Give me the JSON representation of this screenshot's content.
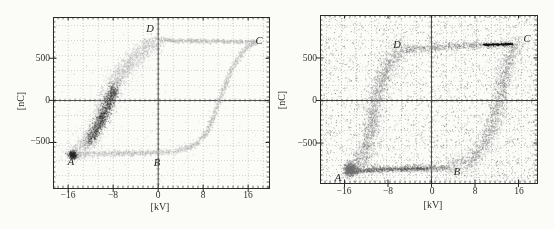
{
  "figure": {
    "background": "#fbfbf8"
  },
  "chart_data": [
    {
      "type": "scatter",
      "panel": "left",
      "title": "",
      "xlabel": "[kV]",
      "ylabel": "[nC]",
      "xlim": [
        -18.7,
        19.7
      ],
      "ylim": [
        -1040,
        990
      ],
      "xticks": [
        -16,
        -8,
        0,
        8,
        16
      ],
      "xtick_labels": [
        "−16",
        "−8",
        "0",
        "8",
        "16"
      ],
      "yticks": [
        -500,
        0,
        500
      ],
      "ytick_labels": [
        "−500",
        "0",
        "500"
      ],
      "grid": "fine-dotted",
      "grid_spacing_px": 15,
      "zero_axes": true,
      "seed": 7,
      "colors": {
        "loop": "#b0b0b0",
        "core": "#262626"
      },
      "corner_labels": [
        {
          "text": "A",
          "x": -15.6,
          "y": -730
        },
        {
          "text": "B",
          "x": -0.2,
          "y": -735
        },
        {
          "text": "C",
          "x": 17.9,
          "y": 715
        },
        {
          "text": "D",
          "x": -1.5,
          "y": 860
        }
      ],
      "loop_summary": {
        "bottom_branch_nC": -630,
        "top_branch_nC": 705,
        "coercive_up_kV": 10.8,
        "descending_band_center_kV": -9.5,
        "A": [
          -15.5,
          -648
        ],
        "B": [
          1.8,
          -616
        ],
        "C": [
          17.5,
          692
        ],
        "D": [
          0.3,
          720
        ]
      },
      "branches": [
        {
          "name": "bottom-A-to-B",
          "points": [
            [
              -15.5,
              -648
            ],
            [
              -13,
              -638
            ],
            [
              -10,
              -632
            ],
            [
              -7,
              -628
            ],
            [
              -4,
              -625
            ],
            [
              -1,
              -621
            ],
            [
              1.8,
              -616
            ]
          ],
          "n": 700,
          "sx": 0.18,
          "sy": 18,
          "color": "#b0b0b0",
          "alpha": 0.5,
          "size": 1
        },
        {
          "name": "rising-B-to-C",
          "points": [
            [
              1.8,
              -616
            ],
            [
              4.5,
              -585
            ],
            [
              6.5,
              -528
            ],
            [
              8,
              -440
            ],
            [
              9,
              -330
            ],
            [
              10,
              -180
            ],
            [
              10.8,
              -20
            ],
            [
              11.8,
              160
            ],
            [
              12.8,
              330
            ],
            [
              13.8,
              460
            ],
            [
              14.8,
              560
            ],
            [
              15.8,
              630
            ],
            [
              16.8,
              672
            ],
            [
              17.5,
              692
            ]
          ],
          "n": 1000,
          "sx": 0.22,
          "sy": 22,
          "color": "#b0b0b0",
          "alpha": 0.5,
          "size": 1
        },
        {
          "name": "top-C-to-D",
          "points": [
            [
              17.5,
              692
            ],
            [
              14,
              698
            ],
            [
              10,
              701
            ],
            [
              6,
              705
            ],
            [
              2,
              710
            ],
            [
              0.3,
              720
            ]
          ],
          "n": 650,
          "sx": 0.2,
          "sy": 13,
          "color": "#b0b0b0",
          "alpha": 0.5,
          "size": 1
        },
        {
          "name": "falling-D-to-A",
          "points": [
            [
              0.3,
              720
            ],
            [
              -1.5,
              650
            ],
            [
              -3.2,
              560
            ],
            [
              -4.8,
              460
            ],
            [
              -6.2,
              355
            ],
            [
              -7.3,
              245
            ],
            [
              -8.2,
              130
            ],
            [
              -9,
              10
            ],
            [
              -9.8,
              -120
            ],
            [
              -10.7,
              -260
            ],
            [
              -11.7,
              -395
            ],
            [
              -12.8,
              -505
            ],
            [
              -14.1,
              -590
            ],
            [
              -15.5,
              -648
            ]
          ],
          "n": 2300,
          "sx": 0.8,
          "sy": 48,
          "color": "#b0b0b0",
          "alpha": 0.42,
          "size": 1
        },
        {
          "name": "falling-halo",
          "points": [
            [
              0.3,
              720
            ],
            [
              -1.5,
              650
            ],
            [
              -3.2,
              560
            ],
            [
              -4.8,
              460
            ],
            [
              -6.2,
              355
            ],
            [
              -7.3,
              245
            ],
            [
              -8.2,
              130
            ],
            [
              -9,
              10
            ],
            [
              -9.8,
              -120
            ],
            [
              -10.7,
              -260
            ],
            [
              -11.7,
              -395
            ],
            [
              -12.8,
              -505
            ],
            [
              -14.1,
              -590
            ],
            [
              -15.5,
              -648
            ]
          ],
          "n": 600,
          "sx": 1.7,
          "sy": 105,
          "color": "#b0b0b0",
          "alpha": 0.28,
          "size": 1
        },
        {
          "name": "dark-core",
          "points": [
            [
              -7.6,
              150
            ],
            [
              -8.3,
              40
            ],
            [
              -9,
              -70
            ],
            [
              -9.8,
              -190
            ],
            [
              -10.6,
              -300
            ],
            [
              -11.5,
              -405
            ],
            [
              -12.3,
              -485
            ]
          ],
          "n": 1500,
          "sx": 0.5,
          "sy": 40,
          "color": "#262626",
          "alpha": 0.3,
          "size": 1
        },
        {
          "name": "A-corner-blob",
          "points": [
            [
              -15.4,
              -628
            ],
            [
              -15,
              -648
            ],
            [
              -15.3,
              -666
            ]
          ],
          "n": 420,
          "sx": 0.35,
          "sy": 20,
          "color": "#262626",
          "alpha": 0.38,
          "size": 1
        }
      ],
      "noise": {
        "n": 160,
        "color": "#b0b0b0",
        "alpha": 0.45,
        "size": 0.9
      }
    },
    {
      "type": "scatter",
      "panel": "right",
      "title": "",
      "xlabel": "[kV]",
      "ylabel": "[nC]",
      "xlim": [
        -20.5,
        19.4
      ],
      "ylim": [
        -970,
        1005
      ],
      "xticks": [
        -16,
        -8,
        0,
        8,
        16
      ],
      "xtick_labels": [
        "−16",
        "−8",
        "0",
        "8",
        "16"
      ],
      "yticks": [
        -500,
        0,
        500
      ],
      "ytick_labels": [
        "−500",
        "0",
        "500"
      ],
      "grid": "fine-dotted",
      "grid_spacing_px": 15,
      "zero_axes": true,
      "seed": 13,
      "colors": {
        "loop": "#7d7d7d",
        "noise": "#565656",
        "bar": "#0d0d0d"
      },
      "corner_labels": [
        {
          "text": "A",
          "x": -17.2,
          "y": -900
        },
        {
          "text": "B",
          "x": 4.7,
          "y": -829
        },
        {
          "text": "C",
          "x": 17.6,
          "y": 735
        },
        {
          "text": "D",
          "x": -6.3,
          "y": 664
        }
      ],
      "loop_summary": {
        "bottom_branch_nC": -800,
        "top_branch_nC": 650,
        "coercive_up_kV": 12.5,
        "descending_band_center_kV": -10.3,
        "A": [
          -15.4,
          -836
        ],
        "B": [
          3.4,
          -792
        ],
        "C": [
          15.4,
          648
        ],
        "D": [
          -4.8,
          602
        ],
        "black_bar": {
          "x_from": 9.6,
          "x_to": 15.0,
          "y": 660
        }
      },
      "branches": [
        {
          "name": "bottom-A-to-B",
          "points": [
            [
              -15.4,
              -836
            ],
            [
              -12,
              -818
            ],
            [
              -8,
              -806
            ],
            [
              -4,
              -800
            ],
            [
              0,
              -798
            ],
            [
              3.4,
              -792
            ]
          ],
          "n": 900,
          "sx": 0.35,
          "sy": 22,
          "color": "#7d7d7d",
          "alpha": 0.5,
          "size": 1
        },
        {
          "name": "bottom-core",
          "points": [
            [
              -15,
              -836
            ],
            [
              -10,
              -815
            ],
            [
              -5,
              -803
            ],
            [
              0,
              -799
            ]
          ],
          "n": 350,
          "sx": 0.3,
          "sy": 12,
          "color": "#4a4a4a",
          "alpha": 0.45,
          "size": 1
        },
        {
          "name": "rising-B-to-C",
          "points": [
            [
              3.4,
              -792
            ],
            [
              6,
              -750
            ],
            [
              8,
              -668
            ],
            [
              9.5,
              -545
            ],
            [
              10.7,
              -390
            ],
            [
              11.7,
              -210
            ],
            [
              12.5,
              0
            ],
            [
              13.2,
              210
            ],
            [
              13.9,
              400
            ],
            [
              14.6,
              535
            ],
            [
              15.1,
              615
            ],
            [
              15.4,
              648
            ]
          ],
          "n": 1500,
          "sx": 0.75,
          "sy": 55,
          "color": "#7d7d7d",
          "alpha": 0.4,
          "size": 1
        },
        {
          "name": "rising-halo",
          "points": [
            [
              3.4,
              -792
            ],
            [
              6,
              -750
            ],
            [
              8,
              -668
            ],
            [
              9.5,
              -545
            ],
            [
              10.7,
              -390
            ],
            [
              11.7,
              -210
            ],
            [
              12.5,
              0
            ],
            [
              13.2,
              210
            ],
            [
              13.9,
              400
            ],
            [
              14.6,
              535
            ],
            [
              15.1,
              615
            ],
            [
              15.4,
              648
            ]
          ],
          "n": 520,
          "sx": 1.7,
          "sy": 130,
          "color": "#7d7d7d",
          "alpha": 0.25,
          "size": 1
        },
        {
          "name": "top-C-to-D",
          "points": [
            [
              15.4,
              648
            ],
            [
              12,
              655
            ],
            [
              8,
              648
            ],
            [
              4,
              636
            ],
            [
              0,
              625
            ],
            [
              -2.4,
              615
            ],
            [
              -4.8,
              602
            ]
          ],
          "n": 750,
          "sx": 0.45,
          "sy": 24,
          "color": "#7d7d7d",
          "alpha": 0.48,
          "size": 1
        },
        {
          "name": "falling-D-to-A",
          "points": [
            [
              -4.8,
              602
            ],
            [
              -6.4,
              535
            ],
            [
              -7.6,
              450
            ],
            [
              -8.5,
              340
            ],
            [
              -9.2,
              220
            ],
            [
              -9.8,
              90
            ],
            [
              -10.3,
              -50
            ],
            [
              -10.8,
              -210
            ],
            [
              -11.3,
              -390
            ],
            [
              -12,
              -560
            ],
            [
              -12.9,
              -700
            ],
            [
              -14,
              -790
            ],
            [
              -15.3,
              -836
            ]
          ],
          "n": 1700,
          "sx": 0.75,
          "sy": 55,
          "color": "#7d7d7d",
          "alpha": 0.4,
          "size": 1
        },
        {
          "name": "falling-halo",
          "points": [
            [
              -4.8,
              602
            ],
            [
              -6.4,
              535
            ],
            [
              -7.6,
              450
            ],
            [
              -8.5,
              340
            ],
            [
              -9.2,
              220
            ],
            [
              -9.8,
              90
            ],
            [
              -10.3,
              -50
            ],
            [
              -10.8,
              -210
            ],
            [
              -11.3,
              -390
            ],
            [
              -12,
              -560
            ],
            [
              -12.9,
              -700
            ],
            [
              -14,
              -790
            ],
            [
              -15.3,
              -836
            ]
          ],
          "n": 550,
          "sx": 1.7,
          "sy": 140,
          "color": "#7d7d7d",
          "alpha": 0.25,
          "size": 1
        },
        {
          "name": "A-corner-blob",
          "points": [
            [
              -15.2,
              -790
            ],
            [
              -14.7,
              -815
            ],
            [
              -15.2,
              -836
            ]
          ],
          "n": 650,
          "sx": 0.5,
          "sy": 35,
          "color": "#6f6f6f",
          "alpha": 0.5,
          "size": 1
        },
        {
          "name": "black-bar-near-C",
          "points": [
            [
              9.6,
              655
            ],
            [
              12.3,
              659
            ],
            [
              15,
              662
            ]
          ],
          "n": 260,
          "sx": 0.15,
          "sy": 5,
          "color": "#0d0d0d",
          "alpha": 0.75,
          "size": 1.1
        }
      ],
      "noise": {
        "n": 3000,
        "color": "#565656",
        "alpha": 0.45,
        "size": 0.9
      }
    }
  ]
}
